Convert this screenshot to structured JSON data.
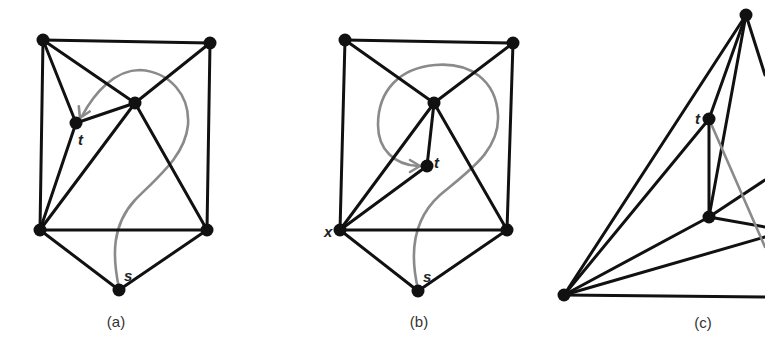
{
  "colors": {
    "edge": "#111111",
    "path": "#8a8a8a",
    "vertex": "#111111",
    "background": "#ffffff"
  },
  "panels": [
    {
      "caption": "(a)",
      "caption_pos": [
        116,
        327
      ],
      "vertices": {
        "tl": [
          43,
          40
        ],
        "tr": [
          210,
          43
        ],
        "c": [
          135,
          103
        ],
        "t": [
          76,
          123
        ],
        "bl": [
          40,
          230
        ],
        "br": [
          207,
          230
        ],
        "s": [
          119,
          290
        ]
      },
      "edges": [
        [
          "tl",
          "tr"
        ],
        [
          "tl",
          "bl"
        ],
        [
          "tr",
          "br"
        ],
        [
          "tl",
          "c"
        ],
        [
          "tl",
          "t"
        ],
        [
          "tr",
          "c"
        ],
        [
          "c",
          "t"
        ],
        [
          "c",
          "bl"
        ],
        [
          "c",
          "br"
        ],
        [
          "t",
          "bl"
        ],
        [
          "bl",
          "br"
        ],
        [
          "bl",
          "s"
        ],
        [
          "br",
          "s"
        ]
      ],
      "labels": [
        {
          "text": "t",
          "x": 78,
          "y": 145
        },
        {
          "text": "s",
          "x": 124,
          "y": 281
        }
      ],
      "curve": "M119,288 C112,255 112,225 135,200 C160,175 185,155 188,125 C190,95 170,72 140,70 C115,70 95,92 82,116",
      "arrow": {
        "tip": [
          80,
          118
        ],
        "angle": 115
      }
    },
    {
      "caption": "(b)",
      "caption_pos": [
        419,
        327
      ],
      "vertices": {
        "tl": [
          345,
          40
        ],
        "tr": [
          513,
          43
        ],
        "c": [
          434,
          103
        ],
        "t": [
          427,
          166
        ],
        "x": [
          340,
          230
        ],
        "br": [
          507,
          230
        ],
        "s": [
          418,
          291
        ]
      },
      "edges": [
        [
          "tl",
          "tr"
        ],
        [
          "tl",
          "x"
        ],
        [
          "tr",
          "br"
        ],
        [
          "tl",
          "c"
        ],
        [
          "tr",
          "c"
        ],
        [
          "c",
          "t"
        ],
        [
          "c",
          "x"
        ],
        [
          "c",
          "br"
        ],
        [
          "t",
          "x"
        ],
        [
          "x",
          "br"
        ],
        [
          "x",
          "s"
        ],
        [
          "br",
          "s"
        ]
      ],
      "labels": [
        {
          "text": "t",
          "x": 434,
          "y": 168
        },
        {
          "text": "s",
          "x": 423,
          "y": 282
        },
        {
          "text": "x",
          "x": 324,
          "y": 237
        }
      ],
      "curve": "M418,289 C410,255 412,220 440,195 C470,170 500,150 498,115 C496,80 470,62 435,65 C400,68 378,90 378,125 C378,150 395,165 418,166",
      "arrow": {
        "tip": [
          420,
          166
        ],
        "angle": 0
      }
    },
    {
      "caption": "(c)",
      "caption_pos": [
        703,
        328
      ],
      "vertices": {
        "top": [
          746,
          15
        ],
        "t": [
          709,
          119
        ],
        "m": [
          709,
          217
        ],
        "bl": [
          564,
          295
        ]
      },
      "edges": [
        [
          "top",
          "bl"
        ],
        [
          "top",
          "t"
        ],
        [
          "top",
          "m"
        ],
        [
          "t",
          "bl"
        ],
        [
          "t",
          "m"
        ],
        [
          "m",
          "bl"
        ]
      ],
      "open_edges": [
        {
          "from": "top",
          "to": [
            765,
            75
          ]
        },
        {
          "from": "m",
          "to": [
            765,
            180
          ]
        },
        {
          "from": "m",
          "to": [
            765,
            227
          ]
        },
        {
          "from": "bl",
          "to": [
            765,
            237
          ]
        },
        {
          "from": "bl",
          "to": [
            765,
            297
          ]
        }
      ],
      "gray_line": {
        "from": "t",
        "to": [
          765,
          247
        ]
      },
      "labels": [
        {
          "text": "t",
          "x": 695,
          "y": 124
        }
      ]
    }
  ]
}
